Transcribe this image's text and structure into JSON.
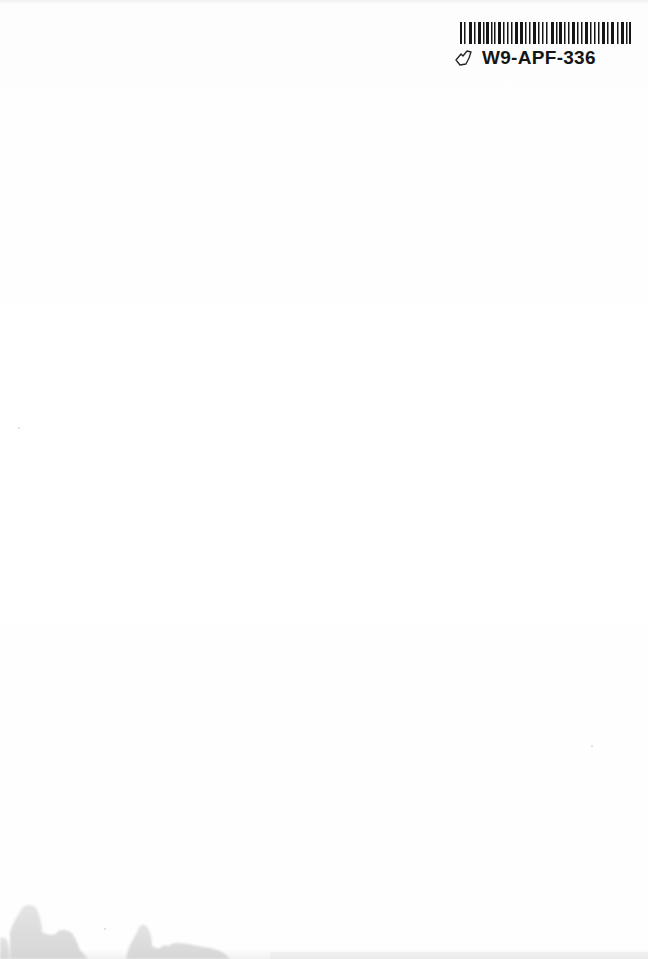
{
  "page": {
    "type": "blank scanned book page",
    "background_color": "#fefefe"
  },
  "barcode_label": {
    "barcode_id": "W9-APF-336",
    "icon": "hand-pointer-icon",
    "bar_color": "#161616"
  },
  "stains": {
    "description": "water stains along bottom-left edge",
    "color": "#d9d9d9"
  }
}
